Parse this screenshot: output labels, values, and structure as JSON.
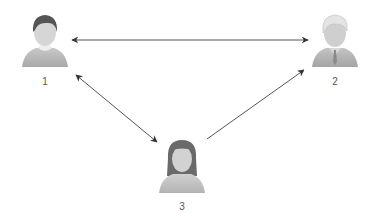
{
  "diagram": {
    "type": "network",
    "nodes": [
      {
        "id": "1",
        "label": "1",
        "avatar": "person-male-dark-hair-icon",
        "x": 45,
        "y": 40
      },
      {
        "id": "2",
        "label": "2",
        "avatar": "person-male-gray-hair-tie-icon",
        "x": 335,
        "y": 40
      },
      {
        "id": "3",
        "label": "3",
        "avatar": "person-female-long-hair-icon",
        "x": 182,
        "y": 165
      }
    ],
    "edges": [
      {
        "from": "1",
        "to": "2",
        "direction": "both"
      },
      {
        "from": "1",
        "to": "3",
        "direction": "both"
      },
      {
        "from": "3",
        "to": "2",
        "direction": "forward"
      }
    ]
  },
  "colors": {
    "arrow": "#3a3a3a",
    "avatar_skin": "#d4d4d4",
    "avatar_body": "#b8b8b8",
    "dark_hair": "#555555",
    "light_hair": "#e2e2e2",
    "label": "#555555",
    "background": "#ffffff"
  }
}
